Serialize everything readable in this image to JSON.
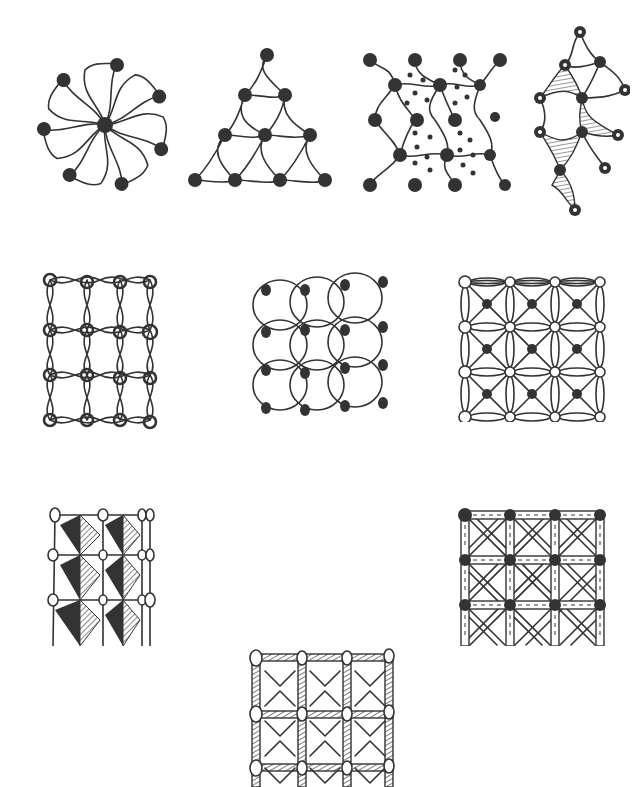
{
  "figure": {
    "colors": {
      "ink": "#333333",
      "background": "#ffffff"
    },
    "rows": [
      {
        "patterns": [
          "pinwheel-swirl-hexagon",
          "swirl-triangle",
          "swirl-grid-dotted",
          "swirl-diamond-hatched"
        ]
      },
      {
        "patterns": [
          "eye-ring-grid",
          "filled-dot-circle-grid",
          "petal-lattice-grid"
        ]
      },
      {
        "patterns": [
          "triangle-hatched-grid",
          "striped-bar-grid",
          "crosshatch-bead-grid"
        ]
      }
    ]
  }
}
